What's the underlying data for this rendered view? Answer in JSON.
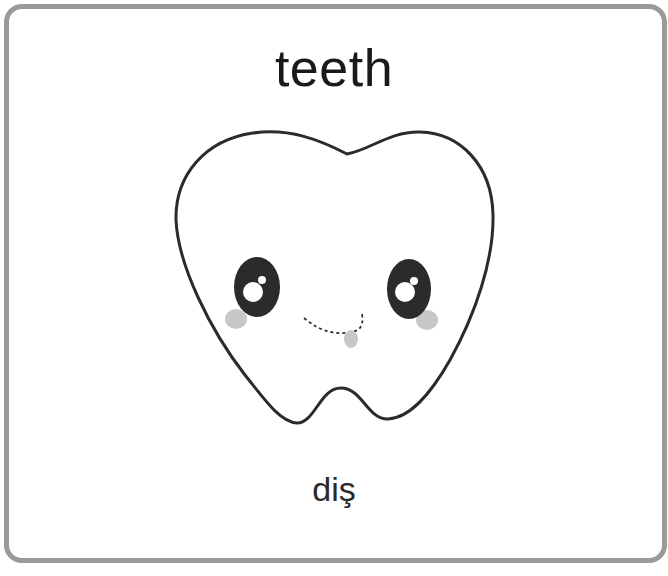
{
  "card": {
    "word_english": "teeth",
    "word_translation": "diş",
    "illustration": "tooth-icon"
  },
  "colors": {
    "border": "#9a9a9a",
    "outline": "#2b2b2b",
    "eye": "#2b2b2b",
    "blush": "#c8c8c8",
    "text": "#1a1a1a"
  }
}
